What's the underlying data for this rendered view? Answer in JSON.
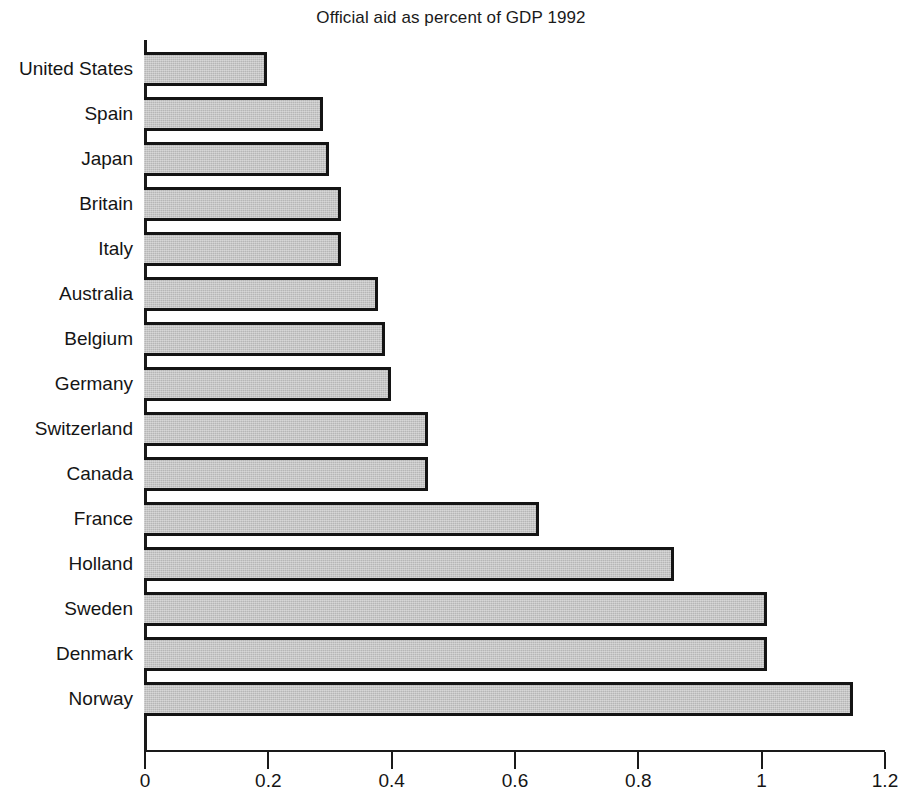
{
  "chart_data": {
    "type": "bar",
    "orientation": "horizontal",
    "title": "Official aid as percent of GDP 1992",
    "xlabel": "",
    "ylabel": "",
    "xlim": [
      0,
      1.2
    ],
    "xticks": [
      "0",
      "0.2",
      "0.4",
      "0.6",
      "0.8",
      "1",
      "1.2"
    ],
    "xtick_values": [
      0,
      0.2,
      0.4,
      0.6,
      0.8,
      1,
      1.2
    ],
    "grid": false,
    "legend": null,
    "categories": [
      "United States",
      "Spain",
      "Japan",
      "Britain",
      "Italy",
      "Australia",
      "Belgium",
      "Germany",
      "Switzerland",
      "Canada",
      "France",
      "Holland",
      "Sweden",
      "Denmark",
      "Norway"
    ],
    "values": [
      0.2,
      0.29,
      0.3,
      0.32,
      0.32,
      0.38,
      0.39,
      0.4,
      0.46,
      0.46,
      0.64,
      0.86,
      1.01,
      1.01,
      1.15
    ],
    "bar_fill_color": "#b6b6b6",
    "bar_edge_color": "#141414",
    "axis_color": "#1a1a1a",
    "background_color": "#ffffff"
  }
}
